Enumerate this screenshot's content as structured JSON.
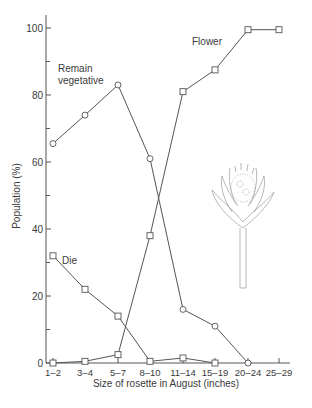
{
  "chart_data": {
    "type": "line",
    "title": "",
    "xlabel": "Size of rosette in August (inches)",
    "ylabel": "Population (%)",
    "ylim": [
      0,
      100
    ],
    "yticks": [
      0,
      20,
      40,
      60,
      80,
      100
    ],
    "grid": false,
    "legend_position": "inline labels",
    "categories": [
      "1–2",
      "3–4",
      "5–7",
      "8–10",
      "11–14",
      "15–19",
      "20–24",
      "25–29"
    ],
    "series": [
      {
        "name": "Remain vegetative",
        "marker": "circle",
        "values": [
          65.5,
          74,
          83,
          61,
          16,
          11,
          0,
          null
        ]
      },
      {
        "name": "Flower",
        "marker": "square",
        "values": [
          0,
          0.5,
          2.5,
          38,
          81,
          87.5,
          99.5,
          99.5
        ]
      },
      {
        "name": "Die",
        "marker": "square",
        "values": [
          32,
          22,
          14,
          0.5,
          1.5,
          0,
          null,
          null
        ]
      }
    ],
    "annotations": [
      "Remain vegetative",
      "Flower",
      "Die",
      "illustration of flowering rosette plant"
    ]
  },
  "labels": {
    "remain_line1": "Remain",
    "remain_line2": "vegetative",
    "flower": "Flower",
    "die": "Die"
  }
}
